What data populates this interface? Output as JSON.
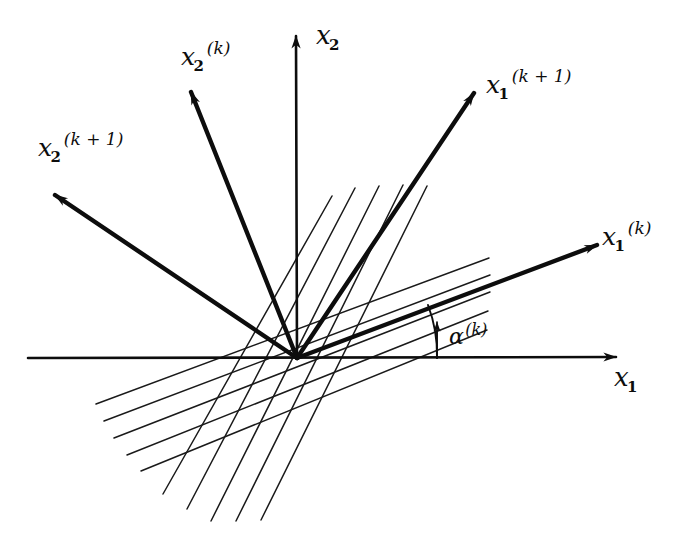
{
  "figure": {
    "kind": "hand-drawn-coordinate-rotation-diagram",
    "background_color": "#ffffff",
    "ink_color": "#0d0d0d"
  },
  "axes": {
    "x1": {
      "label_base": "x",
      "label_sub": "1",
      "label_sup": "",
      "name": "horizontal-axis"
    },
    "x2": {
      "label_base": "x",
      "label_sub": "2",
      "label_sup": "",
      "name": "vertical-axis"
    }
  },
  "vectors": [
    {
      "id": "x1-k",
      "label_base": "x",
      "label_sub": "1",
      "label_sup": "(k)",
      "angle_deg": 22
    },
    {
      "id": "x1-k1",
      "label_base": "x",
      "label_sub": "1",
      "label_sup": "(k + 1)",
      "angle_deg": 58
    },
    {
      "id": "x2-k",
      "label_base": "x",
      "label_sub": "2",
      "label_sup": "(k)",
      "angle_deg": 112
    },
    {
      "id": "x2-k1",
      "label_base": "x",
      "label_sub": "2",
      "label_sup": "(k + 1)",
      "angle_deg": 148
    }
  ],
  "angle_marker": {
    "label_base": "α",
    "label_sub": "",
    "label_sup": "(k)",
    "from": "x1",
    "to": "x1-k",
    "value_deg": 22
  },
  "contours": {
    "family_shallow": {
      "name": "contour-lines-parallel-to-x1k",
      "count": 5,
      "angle_deg": 22
    },
    "family_steep": {
      "name": "contour-lines-parallel-to-x2k",
      "count": 5,
      "angle_deg": 112
    }
  }
}
